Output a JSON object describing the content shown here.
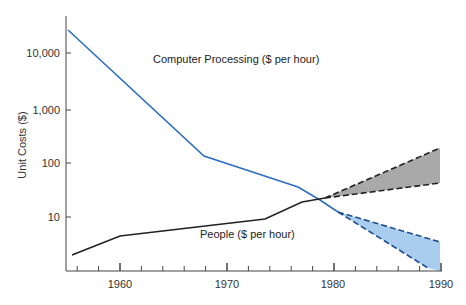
{
  "chart_data": {
    "type": "line",
    "title": "",
    "xlabel": "",
    "ylabel": "Unit Costs ($)",
    "yscale": "log",
    "xlim": [
      1955,
      1990
    ],
    "ylim": [
      1,
      30000
    ],
    "x_ticks": [
      "1960",
      "1970",
      "1980",
      "1990"
    ],
    "y_ticks": [
      "10",
      "100",
      "1,000",
      "10,000"
    ],
    "grid": false,
    "series": [
      {
        "name": "Computer Processing ($ per hour)",
        "color": "#2f6fbf",
        "points": [
          [
            1955,
            25000
          ],
          [
            1968,
            130
          ],
          [
            1977,
            35
          ],
          [
            1979,
            20
          ],
          [
            1980,
            15
          ]
        ]
      },
      {
        "name": "People ($ per hour)",
        "color": "#222222",
        "points": [
          [
            1955,
            2
          ],
          [
            1960,
            4.5
          ],
          [
            1974,
            9
          ],
          [
            1977,
            18
          ],
          [
            1979,
            21
          ]
        ]
      }
    ],
    "projections": [
      {
        "name": "People projection",
        "fill": "#a9a9a9",
        "from": [
          1979,
          21
        ],
        "upper_end": [
          1990,
          180
        ],
        "lower_end": [
          1990,
          40
        ]
      },
      {
        "name": "Computer projection",
        "fill": "#a9cdef",
        "from": [
          1980,
          15
        ],
        "upper_end": [
          1990,
          3.5
        ],
        "lower_end": [
          1989,
          1.2
        ]
      }
    ],
    "annotations": [
      "Computer Processing ($ per hour)",
      "People ($ per hour)"
    ]
  },
  "labels": {
    "y_axis": "Unit Costs ($)",
    "computer": "Computer Processing ($ per hour)",
    "people": "People ($ per hour)",
    "y10000": "10,000",
    "y1000": "1,000",
    "y100": "100",
    "y10": "10",
    "x1960": "1960",
    "x1970": "1970",
    "x1980": "1980",
    "x1990": "1990"
  }
}
